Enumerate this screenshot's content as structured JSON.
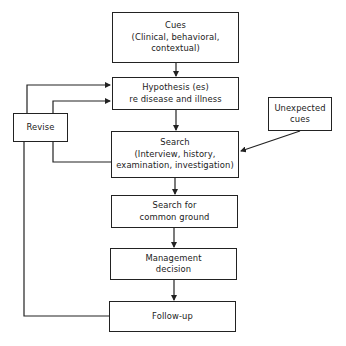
{
  "diagram": {
    "type": "flowchart",
    "nodes": {
      "cues": {
        "lines": [
          "Cues",
          "(Clinical, behavioral,",
          "contextual)"
        ]
      },
      "hypothesis": {
        "lines": [
          "Hypothesis (es)",
          "re disease and illness"
        ]
      },
      "revise": {
        "lines": [
          "Revise"
        ]
      },
      "unexpected": {
        "lines": [
          "Unexpected",
          "cues"
        ]
      },
      "search": {
        "lines": [
          "Search",
          "(Interview, history,",
          "examination, investigation)"
        ]
      },
      "common_ground": {
        "lines": [
          "Search for",
          "common ground"
        ]
      },
      "management": {
        "lines": [
          "Management",
          "decision"
        ]
      },
      "followup": {
        "lines": [
          "Follow-up"
        ]
      }
    },
    "edges": [
      {
        "from": "Cues",
        "to": "Hypothesis (es) re disease and illness"
      },
      {
        "from": "Hypothesis (es) re disease and illness",
        "to": "Search"
      },
      {
        "from": "Unexpected cues",
        "to": "Search"
      },
      {
        "from": "Search",
        "to": "Search for common ground"
      },
      {
        "from": "Search for common ground",
        "to": "Management decision"
      },
      {
        "from": "Management decision",
        "to": "Follow-up"
      },
      {
        "from": "Search",
        "to": "Revise"
      },
      {
        "from": "Follow-up",
        "to": "Revise"
      },
      {
        "from": "Revise",
        "to": "Hypothesis (es) re disease and illness"
      },
      {
        "from": "Revise",
        "to": "Hypothesis (es) re disease and illness"
      }
    ],
    "colors": {
      "line": "#222222",
      "background": "#ffffff"
    }
  }
}
